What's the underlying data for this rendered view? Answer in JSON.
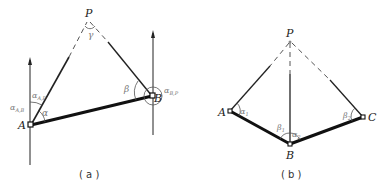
{
  "figure_a": {
    "caption": "( a )",
    "points": {
      "P": "P",
      "A": "A",
      "B": "B"
    },
    "angles": {
      "gamma": "γ",
      "alpha": "α",
      "beta": "β",
      "alpha_AP": "α",
      "alpha_AP_sub": "A,P",
      "alpha_AB": "α",
      "alpha_AB_sub": "A,B",
      "alpha_BP": "α",
      "alpha_BP_sub": "B,P"
    }
  },
  "figure_b": {
    "caption": "( b )",
    "points": {
      "P": "P",
      "A": "A",
      "B": "B",
      "C": "C"
    },
    "angles": {
      "alpha1": "α",
      "alpha1_sub": "1",
      "beta1": "β",
      "beta1_sub": "1",
      "alpha2": "α",
      "alpha2_sub": "2",
      "beta2": "β",
      "beta2_sub": "2"
    }
  }
}
